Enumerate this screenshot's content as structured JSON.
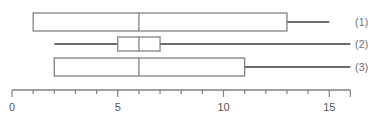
{
  "chart_data": {
    "type": "box",
    "title": "",
    "xlabel": "",
    "ylabel": "",
    "orientation": "horizontal",
    "xlim": [
      0,
      16
    ],
    "grid": false,
    "legend": "none",
    "axis": {
      "major_ticks": [
        0,
        5,
        10,
        15
      ],
      "minor_ticks": [
        1,
        2,
        3,
        4,
        6,
        7,
        8,
        9,
        11,
        12,
        13,
        14,
        16
      ],
      "tick_labels": [
        "0",
        "5",
        "10",
        "15"
      ],
      "tick_label_values": [
        0,
        5,
        10,
        15
      ],
      "tick_interval": 1,
      "axis_start": 0,
      "axis_end": 16
    },
    "categories": [
      "(1)",
      "(2)",
      "(3)"
    ],
    "boxes": [
      {
        "label": "(1)",
        "lower_whisker": 1,
        "q1": 1,
        "median": 6,
        "q3": 13,
        "upper_whisker": 15
      },
      {
        "label": "(2)",
        "lower_whisker": 2,
        "q1": 5,
        "median": 6,
        "q3": 7,
        "upper_whisker": 16
      },
      {
        "label": "(3)",
        "lower_whisker": 2,
        "q1": 2,
        "median": 6,
        "q3": 11,
        "upper_whisker": 16
      }
    ]
  },
  "colors": {
    "box_stroke": "#808285",
    "whisker": "#6d6e71",
    "axis": "#808285",
    "tick_label": "#58595b",
    "series_label": "#6d6e71",
    "box_fill": "#ffffff",
    "background": "#ffffff"
  },
  "labels": {
    "series": [
      "(1)",
      "(2)",
      "(3)"
    ],
    "ticks": [
      "0",
      "5",
      "10",
      "15"
    ]
  }
}
